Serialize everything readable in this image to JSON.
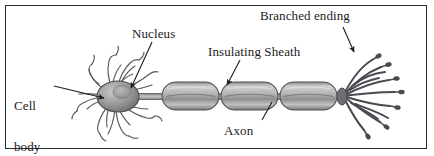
{
  "figure": {
    "kind": "neuron-anatomy-diagram",
    "frame": {
      "border_color": "#2b2b33",
      "background_color": "#ffffff"
    },
    "ink_color": "#1b1b20",
    "structure_fill_light": "#d4d4d4",
    "structure_fill_mid": "#9a9a9a",
    "structure_fill_dark": "#6e6e6e"
  },
  "labels": {
    "cell_body": "Cell\nbody",
    "cell_body_line1": "Cell",
    "cell_body_line2": "body",
    "nucleus": "Nucleus",
    "insulating_sheath": "Insulating Sheath",
    "axon": "Axon",
    "branched_ending": "Branched ending"
  },
  "parts": [
    {
      "id": "cell-body",
      "label": "Cell body",
      "pointer": "arrow",
      "pointer_direction": "right"
    },
    {
      "id": "nucleus",
      "label": "Nucleus",
      "pointer": "leader-line",
      "pointer_direction": "down-left"
    },
    {
      "id": "insulating-sheath",
      "label": "Insulating Sheath",
      "pointer": "arrow",
      "pointer_direction": "down-left"
    },
    {
      "id": "axon",
      "label": "Axon",
      "pointer": "leader-line",
      "pointer_direction": "up-right"
    },
    {
      "id": "branched-ending",
      "label": "Branched ending",
      "pointer": "arrow",
      "pointer_direction": "down-right"
    }
  ],
  "counts": {
    "myelin_segments": 3,
    "terminal_branches": 11
  }
}
